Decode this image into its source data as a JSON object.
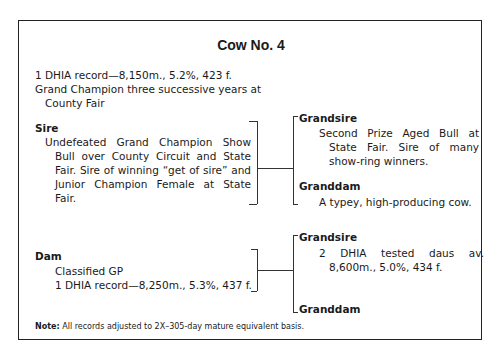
{
  "title": "Cow No. 4",
  "summary": {
    "record": "1 DHIA record—8,150m., 5.2%, 423 f.",
    "award_line1": "Grand Champion three successive years at",
    "award_line2": "County Fair"
  },
  "sire": {
    "label": "Sire",
    "description": "Undefeated Grand Champion Show Bull over County Circuit and State Fair. Sire of winning “get of sire” and Junior Champion Female at State Fair.",
    "grandsire": {
      "label": "Grandsire",
      "description": "Second Prize Aged Bull at State Fair. Sire of many show-ring winners."
    },
    "granddam": {
      "label": "Granddam",
      "description": "A typey, high-producing cow."
    }
  },
  "dam": {
    "label": "Dam",
    "line1": "Classified GP",
    "line2": "1 DHIA record—8,250m., 5.3%, 437 f.",
    "grandsire": {
      "label": "Grandsire",
      "description": "2 DHIA tested daus av. 8,600m., 5.0%, 434 f."
    },
    "granddam": {
      "label": "Granddam",
      "description": ""
    }
  },
  "note": {
    "label": "Note:",
    "text": " All records adjusted to 2X–305-day mature equivalent basis."
  }
}
